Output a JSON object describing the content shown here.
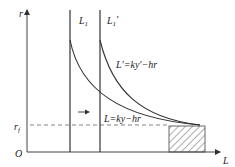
{
  "diagram": {
    "axes": {
      "y_label": "r",
      "x_label": "L",
      "origin_label": "O",
      "rf_label": "r",
      "rf_subscript": "f"
    },
    "lines": {
      "L1": {
        "label": "L",
        "subscript": "1"
      },
      "L1_prime": {
        "label": "L",
        "subscript": "1",
        "prime": "'"
      }
    },
    "curves": {
      "shifted": {
        "label": "L'=ky'−hr"
      },
      "original": {
        "label": "L=ky−hr"
      }
    },
    "arrow": {
      "direction": "right"
    },
    "colors": {
      "line": "#333333",
      "dashed": "#777777",
      "hatch": "#555555"
    }
  }
}
